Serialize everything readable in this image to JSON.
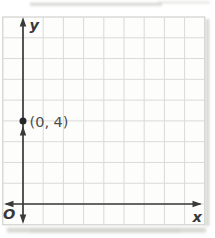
{
  "figure": {
    "type": "coordinate-plane",
    "labels": {
      "y_axis": "y",
      "x_axis": "x",
      "origin": "O",
      "point": "(0, 4)"
    },
    "point": {
      "x": 0,
      "y": 4
    },
    "grid": {
      "columns": 10,
      "rows": 10,
      "units_per_cell": 1
    },
    "colors": {
      "axis": "#3a3a3a",
      "grid_line": "#d9dbd8",
      "border": "#c7c9c6",
      "paper": "#fdfdfb",
      "point": "#262626",
      "axis_label": "#383838",
      "point_label": "#4d4d4d",
      "smudge": "#d2d2ce"
    }
  }
}
